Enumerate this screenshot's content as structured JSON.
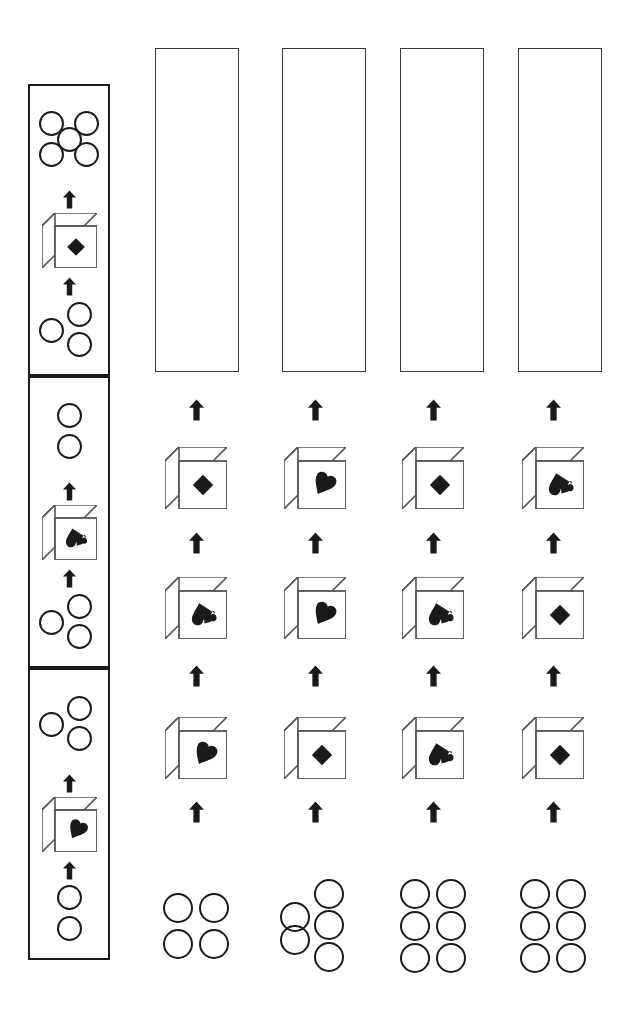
{
  "puzzle": {
    "type": "visual-sequence-matrix",
    "title": "Cube rotation sequence puzzle",
    "background_color": "#ffffff",
    "ink_color": "#1a1a1a",
    "box_border_color": "#3a3a3a"
  },
  "example_column": {
    "label": "example-column",
    "x": 28,
    "y": 84,
    "width": 82,
    "panel_height": 292,
    "panels": [
      {
        "label": "example-panel-1",
        "top_dots": {
          "count": 5,
          "pattern": "quincunx"
        },
        "cube": {
          "face_symbol": "diamond",
          "symbol_char": "♦"
        },
        "bottom_dots": {
          "count": 3,
          "pattern": "triangle"
        }
      },
      {
        "label": "example-panel-2",
        "top_dots": {
          "count": 2,
          "pattern": "vertical"
        },
        "cube": {
          "face_symbol": "spade",
          "symbol_char": "♠"
        },
        "bottom_dots": {
          "count": 3,
          "pattern": "triangle"
        }
      },
      {
        "label": "example-panel-3",
        "top_dots": {
          "count": 3,
          "pattern": "triangle"
        },
        "cube": {
          "face_symbol": "heart",
          "symbol_char": "♥"
        },
        "bottom_dots": {
          "count": 2,
          "pattern": "vertical"
        }
      }
    ]
  },
  "answer_columns": [
    {
      "label": "answer-column-1",
      "center_x": 196,
      "answer_box": {
        "label": "answer-box-1",
        "x": 155,
        "y": 48,
        "width": 84,
        "height": 324,
        "value": ""
      },
      "cubes": [
        {
          "face_symbol": "diamond",
          "symbol_char": "♦",
          "position": "upper"
        },
        {
          "face_symbol": "spade",
          "symbol_char": "♠",
          "position": "middle"
        },
        {
          "face_symbol": "heart",
          "symbol_char": "♥",
          "position": "lower"
        }
      ],
      "bottom_dots": {
        "count": 4,
        "pattern": "grid-2x2"
      }
    },
    {
      "label": "answer-column-2",
      "center_x": 315,
      "answer_box": {
        "label": "answer-box-2",
        "x": 282,
        "y": 48,
        "width": 84,
        "height": 324,
        "value": ""
      },
      "cubes": [
        {
          "face_symbol": "heart",
          "symbol_char": "♥",
          "position": "upper"
        },
        {
          "face_symbol": "heart",
          "symbol_char": "♥",
          "position": "middle"
        },
        {
          "face_symbol": "diamond",
          "symbol_char": "♦",
          "position": "lower"
        }
      ],
      "bottom_dots": {
        "count": 5,
        "pattern": "staggered-2-3"
      }
    },
    {
      "label": "answer-column-3",
      "center_x": 433,
      "answer_box": {
        "label": "answer-box-3",
        "x": 400,
        "y": 48,
        "width": 84,
        "height": 324,
        "value": ""
      },
      "cubes": [
        {
          "face_symbol": "diamond",
          "symbol_char": "♦",
          "position": "upper"
        },
        {
          "face_symbol": "spade",
          "symbol_char": "♠",
          "position": "middle"
        },
        {
          "face_symbol": "spade",
          "symbol_char": "♠",
          "position": "lower"
        }
      ],
      "bottom_dots": {
        "count": 6,
        "pattern": "grid-3x2"
      }
    },
    {
      "label": "answer-column-4",
      "center_x": 553,
      "answer_box": {
        "label": "answer-box-4",
        "x": 518,
        "y": 48,
        "width": 84,
        "height": 324,
        "value": ""
      },
      "cubes": [
        {
          "face_symbol": "spade",
          "symbol_char": "♠",
          "position": "upper"
        },
        {
          "face_symbol": "diamond",
          "symbol_char": "♦",
          "position": "middle"
        },
        {
          "face_symbol": "diamond",
          "symbol_char": "♦",
          "position": "lower"
        }
      ],
      "bottom_dots": {
        "count": 6,
        "pattern": "grid-3x2"
      }
    }
  ],
  "arrows": {
    "direction": "up",
    "icon": "arrow-up-icon",
    "count_per_answer_column": 4,
    "count_per_example_panel": 2
  }
}
